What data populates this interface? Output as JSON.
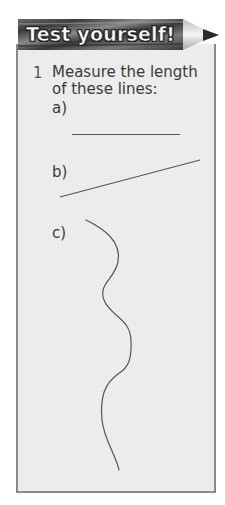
{
  "banner": {
    "title": "Test yourself!",
    "colors": {
      "pencil_body": "#4a4a4a",
      "pencil_tip_wood": "#d6d6d6",
      "pencil_lead": "#2a2a2a"
    }
  },
  "panel": {
    "fill": "#ececec",
    "border": "#8a8a8a"
  },
  "question": {
    "number": "1",
    "text": "Measure the length of these lines:",
    "parts": [
      {
        "label": "a)",
        "line_type": "straight-horizontal"
      },
      {
        "label": "b)",
        "line_type": "straight-diagonal"
      },
      {
        "label": "c)",
        "line_type": "wavy-curve"
      }
    ]
  }
}
